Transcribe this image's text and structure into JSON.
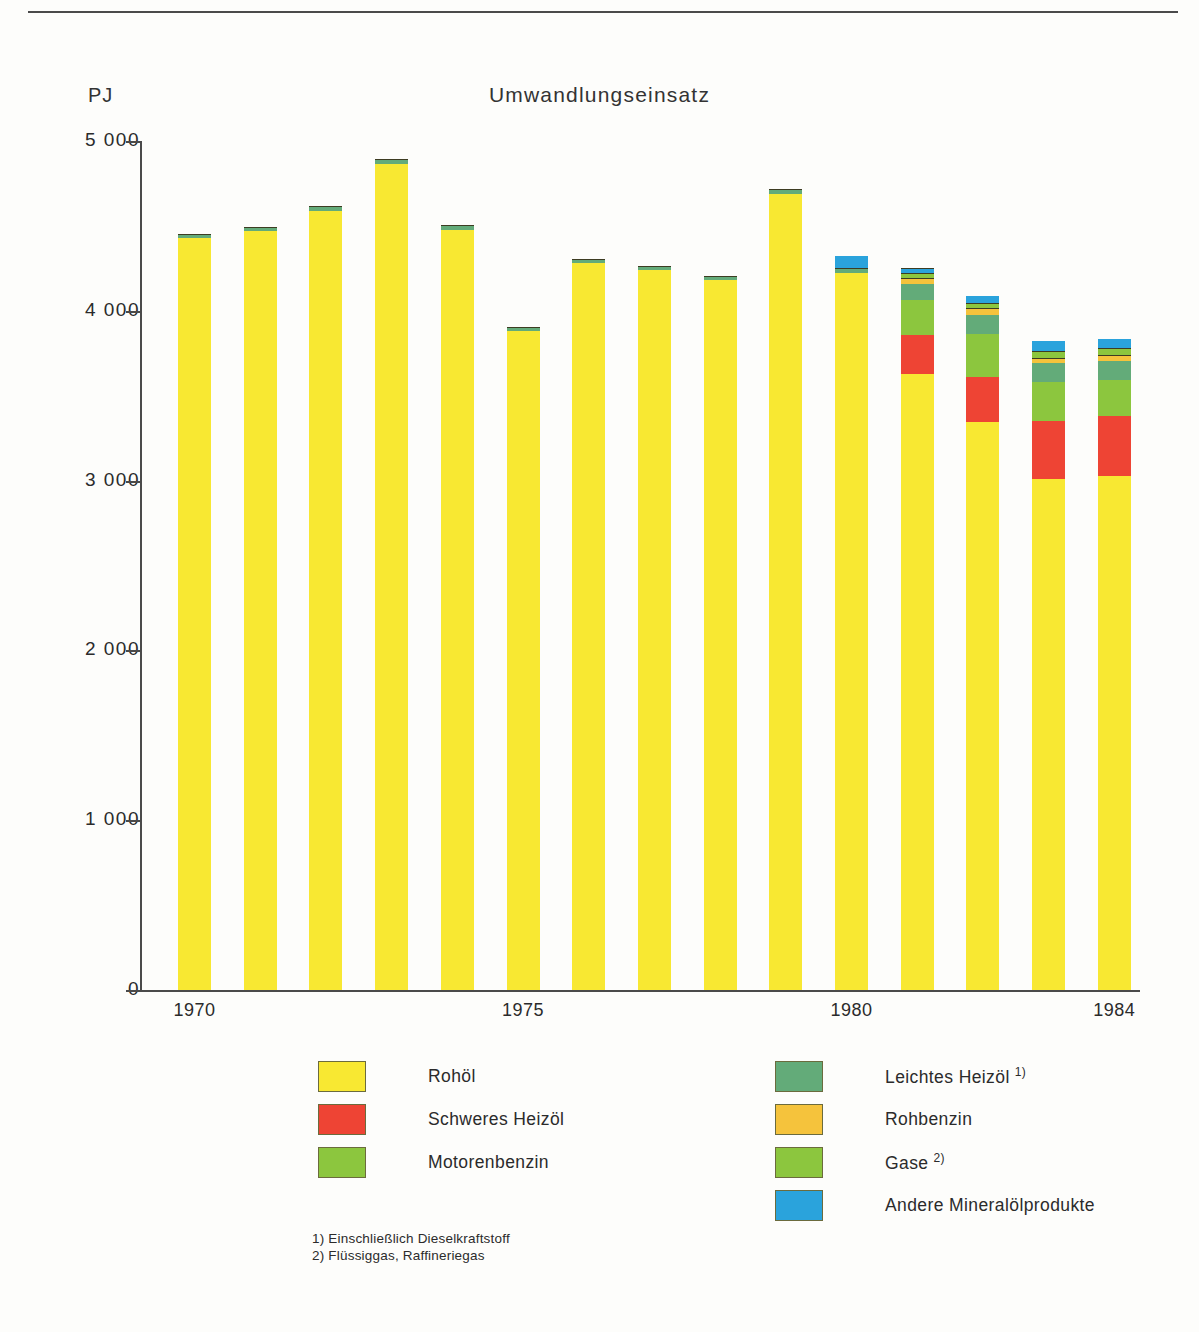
{
  "chart_data": {
    "type": "bar",
    "stacked": true,
    "title": "Umwandlungseinsatz",
    "unit_label": "PJ",
    "xlabel": "",
    "ylabel": "PJ",
    "ylim": [
      0,
      5000
    ],
    "ytick_labels": [
      "0",
      "1 000",
      "2 000",
      "3 000",
      "4 000",
      "5 000"
    ],
    "ytick_values": [
      0,
      1000,
      2000,
      3000,
      4000,
      5000
    ],
    "grid": false,
    "legend_position": "below",
    "categories": [
      "1970",
      "1971",
      "1972",
      "1973",
      "1974",
      "1975",
      "1976",
      "1977",
      "1978",
      "1979",
      "1980",
      "1981",
      "1982",
      "1983",
      "1984"
    ],
    "xtick_labels": [
      "1970",
      "1975",
      "1980",
      "1984"
    ],
    "xtick_categories": [
      "1970",
      "1975",
      "1980",
      "1984"
    ],
    "series": [
      {
        "name": "Rohöl",
        "color": "#f8e832",
        "values": [
          4430,
          4470,
          4585,
          4865,
          4475,
          3880,
          4280,
          4240,
          4180,
          4690,
          4225,
          3630,
          3345,
          3010,
          3025
        ]
      },
      {
        "name": "Schweres Heizöl",
        "color": "#ee4434",
        "values": [
          0,
          0,
          0,
          0,
          0,
          0,
          0,
          0,
          0,
          0,
          0,
          225,
          265,
          340,
          355
        ]
      },
      {
        "name": "Motorenbenzin",
        "color": "#8cc63e",
        "values": [
          0,
          0,
          0,
          0,
          0,
          0,
          0,
          0,
          0,
          0,
          0,
          210,
          255,
          230,
          215
        ]
      },
      {
        "name": "Leichtes Heizöl",
        "color": "#63ab79",
        "values": [
          25,
          25,
          30,
          30,
          30,
          25,
          25,
          25,
          25,
          25,
          25,
          95,
          110,
          110,
          110
        ]
      },
      {
        "name": "Rohbenzin",
        "color": "#f5c33c",
        "values": [
          0,
          0,
          0,
          0,
          0,
          0,
          0,
          0,
          0,
          0,
          0,
          35,
          40,
          35,
          35
        ]
      },
      {
        "name": "Gase",
        "color": "#8cc63e",
        "values": [
          0,
          0,
          0,
          0,
          0,
          0,
          0,
          0,
          0,
          0,
          0,
          25,
          30,
          40,
          40
        ]
      },
      {
        "name": "Andere Mineralölprodukte",
        "color": "#2aa3dc",
        "values": [
          0,
          0,
          0,
          0,
          0,
          0,
          0,
          0,
          0,
          0,
          75,
          30,
          45,
          60,
          55
        ]
      }
    ],
    "totals": [
      4455,
      4495,
      4615,
      4895,
      4505,
      3905,
      4305,
      4265,
      4205,
      4715,
      4325,
      4250,
      4090,
      3825,
      3835
    ]
  },
  "legend": {
    "left_items": [
      {
        "label": "Rohöl",
        "color": "#f8e832",
        "footnote": ""
      },
      {
        "label": "Schweres Heizöl",
        "color": "#ee4434",
        "footnote": ""
      },
      {
        "label": "Motorenbenzin",
        "color": "#8cc63e",
        "footnote": ""
      }
    ],
    "right_items": [
      {
        "label": "Leichtes Heizöl",
        "color": "#63ab79",
        "footnote": "1)"
      },
      {
        "label": "Rohbenzin",
        "color": "#f5c33c",
        "footnote": ""
      },
      {
        "label": "Gase",
        "color": "#8cc63e",
        "footnote": "2)"
      },
      {
        "label": "Andere Mineralölprodukte",
        "color": "#2aa3dc",
        "footnote": ""
      }
    ]
  },
  "footnotes": [
    "1) Einschließlich Dieselkraftstoff",
    "2) Flüssiggas, Raffineriegas"
  ]
}
